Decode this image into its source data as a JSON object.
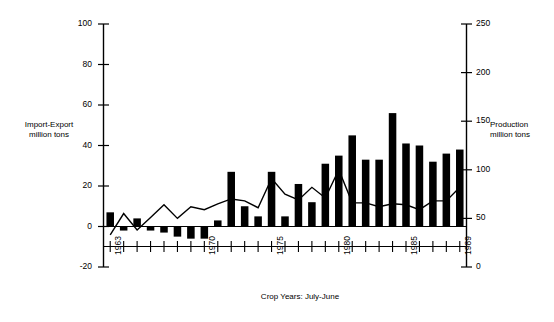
{
  "chart_data": {
    "type": "bar",
    "title": "",
    "subtitle": "",
    "xlabel": "Crop Years: July-June",
    "x": [
      1963,
      1964,
      1965,
      1966,
      1967,
      1968,
      1969,
      1970,
      1971,
      1972,
      1973,
      1974,
      1975,
      1976,
      1977,
      1978,
      1979,
      1980,
      1981,
      1982,
      1983,
      1984,
      1985,
      1986,
      1987,
      1988,
      1989
    ],
    "xtick_labels_shown": [
      "1963",
      "1970",
      "1975",
      "1980",
      "1985",
      "1989"
    ],
    "grid": false,
    "legend": false,
    "axes": [
      {
        "side": "left",
        "label": "Import-Export million tons",
        "label_line1": "Import-Export",
        "label_line2": "million tons",
        "range": [
          -20,
          100
        ],
        "ticks": [
          -20,
          0,
          20,
          40,
          60,
          80,
          100
        ],
        "tick_labels": [
          "-20",
          "0",
          "20",
          "40",
          "60",
          "80",
          "100"
        ]
      },
      {
        "side": "right",
        "label": "Production million tons",
        "label_line1": "Production",
        "label_line2": "million tons",
        "range": [
          0,
          250
        ],
        "ticks": [
          0,
          50,
          100,
          150,
          200,
          250
        ],
        "tick_labels": [
          "0",
          "50",
          "100",
          "150",
          "200",
          "250"
        ]
      }
    ],
    "series": [
      {
        "name": "Import-Export million tons",
        "type": "bar",
        "axis": "left",
        "color": "#000000",
        "values": [
          7,
          -2,
          4,
          -2,
          -3,
          -5,
          -6,
          -6,
          3,
          27,
          10,
          5,
          27,
          5,
          21,
          12,
          31,
          35,
          45,
          33,
          33,
          56,
          41,
          40,
          32,
          36,
          38
        ]
      },
      {
        "name": "Production million tons",
        "type": "line",
        "axis": "right",
        "color": "#000000",
        "values": [
          33,
          55,
          38,
          51,
          64,
          50,
          62,
          59,
          65,
          70,
          68,
          61,
          91,
          75,
          69,
          82,
          71,
          100,
          66,
          66,
          62,
          65,
          64,
          59,
          68,
          68,
          82
        ]
      }
    ]
  },
  "figure": {
    "xlabel": "Crop Years: July-June"
  }
}
